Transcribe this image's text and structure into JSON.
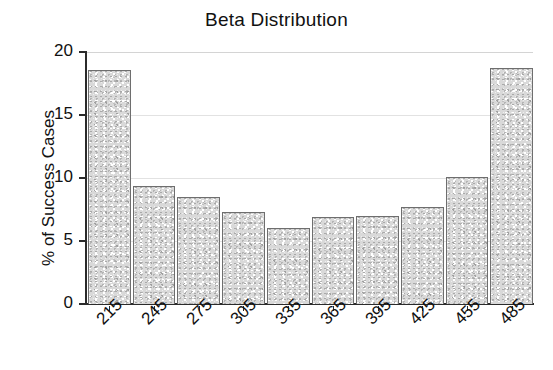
{
  "chart_data": {
    "type": "bar",
    "title": "Beta Distribution",
    "xlabel": "",
    "ylabel": "% of Success Cases",
    "categories": [
      "215",
      "245",
      "275",
      "305",
      "335",
      "365",
      "395",
      "425",
      "455",
      "485"
    ],
    "values": [
      18.6,
      9.4,
      8.5,
      7.3,
      6.0,
      6.9,
      7.0,
      7.7,
      10.1,
      18.7
    ],
    "ylim": [
      0,
      20
    ],
    "yticks": [
      0,
      5,
      10,
      15,
      20
    ],
    "ytick_labels": [
      "0",
      "5",
      "10",
      "15",
      "20"
    ],
    "grid": true,
    "legend": false,
    "bar_fill": "#d9d9d9",
    "bar_edge": "#6e6e6e",
    "axis_color": "#2b2b2b",
    "background": "#ffffff"
  },
  "figure": {
    "title": "Beta Distribution",
    "y_axis_title": "% of Success Cases"
  }
}
